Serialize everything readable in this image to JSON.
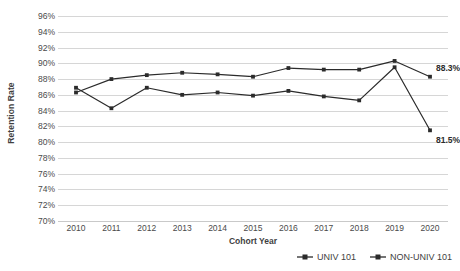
{
  "chart_data": {
    "type": "line",
    "title": "",
    "xlabel": "Cohort Year",
    "ylabel": "Retention Rate",
    "categories": [
      "2010",
      "2011",
      "2012",
      "2013",
      "2014",
      "2015",
      "2016",
      "2017",
      "2018",
      "2019",
      "2020"
    ],
    "x": [
      2010,
      2011,
      2012,
      2013,
      2014,
      2015,
      2016,
      2017,
      2018,
      2019,
      2020
    ],
    "series": [
      {
        "name": "UNIV 101",
        "values": [
          86.3,
          88.0,
          88.5,
          88.8,
          88.6,
          88.3,
          89.4,
          89.2,
          89.2,
          90.3,
          88.3
        ],
        "color": "#2b2b2b",
        "marker": "square"
      },
      {
        "name": "NON-UNIV 101",
        "values": [
          86.9,
          84.3,
          86.9,
          86.0,
          86.3,
          85.9,
          86.5,
          85.8,
          85.3,
          89.5,
          81.5
        ],
        "color": "#2b2b2b",
        "marker": "square"
      }
    ],
    "ylim": [
      70,
      96
    ],
    "ytick_step": 2,
    "ytick_labels": [
      "96%",
      "94%",
      "92%",
      "90%",
      "88%",
      "86%",
      "84%",
      "82%",
      "80%",
      "78%",
      "76%",
      "74%",
      "72%",
      "70%"
    ],
    "ytick_values": [
      96,
      94,
      92,
      90,
      88,
      86,
      84,
      82,
      80,
      78,
      76,
      74,
      72,
      70
    ],
    "grid": true,
    "grid_color": "#d6d6d6",
    "legend_position": "bottom-right",
    "annotations": [
      {
        "text": "88.3%",
        "series": "UNIV 101",
        "x": 2020,
        "y": 88.3
      },
      {
        "text": "81.5%",
        "series": "NON-UNIV 101",
        "x": 2020,
        "y": 81.5
      }
    ]
  },
  "legend": {
    "items": [
      {
        "label": "UNIV 101"
      },
      {
        "label": "NON-UNIV 101"
      }
    ]
  }
}
